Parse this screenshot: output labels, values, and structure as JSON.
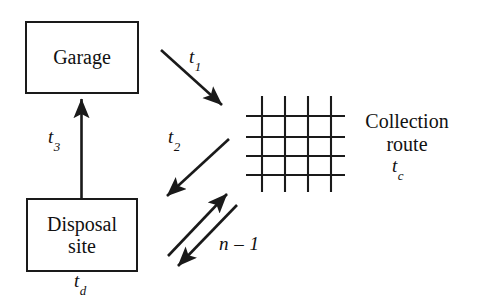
{
  "diagram": {
    "background_color": "#ffffff",
    "stroke_color": "#1a1a1a",
    "nodes": [
      {
        "id": "garage",
        "label": "Garage",
        "shape": "rectangle"
      },
      {
        "id": "disposal_site",
        "label": "Disposal\nsite",
        "shape": "rectangle"
      },
      {
        "id": "collection_route",
        "label": "Collection\nroute",
        "shape": "grid"
      }
    ],
    "grid": {
      "name": "collection-route-grid",
      "vertical_lines": 4,
      "horizontal_lines": 4
    },
    "edges": [
      {
        "id": "t1",
        "label": "t",
        "subscript": "1",
        "from": "garage",
        "to": "collection_route",
        "direction": "down-right",
        "arrowheads": 1
      },
      {
        "id": "t2",
        "label": "t",
        "subscript": "2",
        "from": "collection_route",
        "to": "disposal_site",
        "direction": "down-left",
        "arrowheads": 1
      },
      {
        "id": "t3",
        "label": "t",
        "subscript": "3",
        "from": "disposal_site",
        "to": "garage",
        "direction": "up",
        "arrowheads": 1
      },
      {
        "id": "n_minus_1",
        "label": "n – 1",
        "from": "disposal_site",
        "to": "collection_route",
        "direction": "bidirectional-pair",
        "arrowheads": 2
      }
    ],
    "annotations": [
      {
        "id": "tc",
        "label": "t",
        "subscript": "c",
        "attached_to": "collection_route"
      },
      {
        "id": "td",
        "label": "t",
        "subscript": "d",
        "attached_to": "disposal_site"
      }
    ]
  }
}
